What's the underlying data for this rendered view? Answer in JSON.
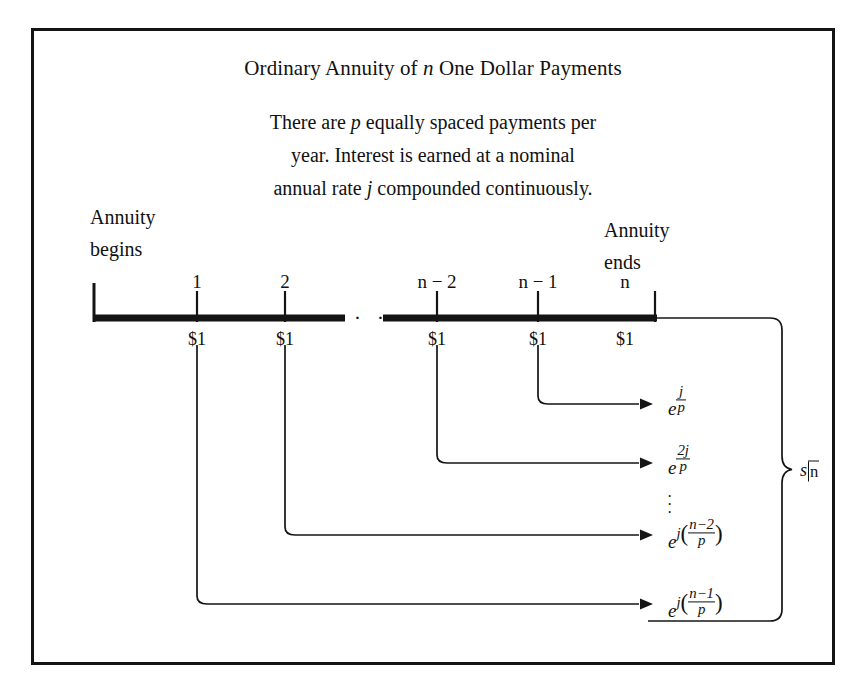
{
  "figure": {
    "title_parts": {
      "before": "Ordinary Annuity of ",
      "italic": "n",
      "after": " One Dollar Payments"
    },
    "subtitle_lines": [
      {
        "a": "There are ",
        "it": "p",
        "b": " equally spaced payments per"
      },
      {
        "a": "year. Interest is earned at a nominal",
        "it": "",
        "b": ""
      },
      {
        "a": "annual rate ",
        "it": "j",
        "b": " compounded continuously."
      }
    ],
    "left_label": {
      "line1": "Annuity",
      "line2": "begins"
    },
    "right_label": {
      "line1": "Annuity",
      "line2": "ends"
    },
    "timeline": {
      "tick_labels": [
        "1",
        "2",
        "n − 2",
        "n − 1",
        "n"
      ],
      "payment_labels": [
        "$1",
        "$1",
        "$1",
        "$1",
        "$1"
      ],
      "break_dots": "· · ·"
    },
    "accumulations": [
      {
        "base": "e",
        "exp_kind": "frac",
        "num": "j",
        "den": "p"
      },
      {
        "base": "e",
        "exp_kind": "frac",
        "num": "2j",
        "den": "p"
      },
      {
        "base": "e",
        "exp_kind": "coefffrac",
        "coeff": "j",
        "num": "n−2",
        "den": "p"
      },
      {
        "base": "e",
        "exp_kind": "coefffrac",
        "coeff": "j",
        "num": "n−1",
        "den": "p"
      }
    ],
    "vertical_dots": "⋮",
    "brace_label": {
      "symbol": "s",
      "angle_n": "n"
    },
    "colors": {
      "ink": "#141414",
      "background": "#ffffff"
    }
  }
}
